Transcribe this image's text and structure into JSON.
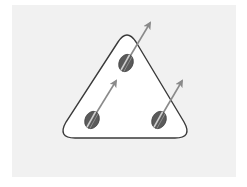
{
  "diagram": {
    "colors": {
      "background": "#ffffff",
      "panel": "#f1f1f1",
      "boundary_fill": "#ffffff",
      "boundary_stroke": "#3a3a3a",
      "particle_fill": "#5a5a5a",
      "particle_stripe": "#cfcfcf",
      "arrow": "#8a8a8a"
    },
    "particles": [
      {
        "id": "top",
        "cx": 126,
        "cy": 63,
        "arrow_to": [
          151,
          22
        ]
      },
      {
        "id": "bottom-left",
        "cx": 92,
        "cy": 120,
        "arrow_to": [
          117,
          80
        ]
      },
      {
        "id": "bottom-right",
        "cx": 159,
        "cy": 120,
        "arrow_to": [
          183,
          80
        ]
      }
    ]
  }
}
